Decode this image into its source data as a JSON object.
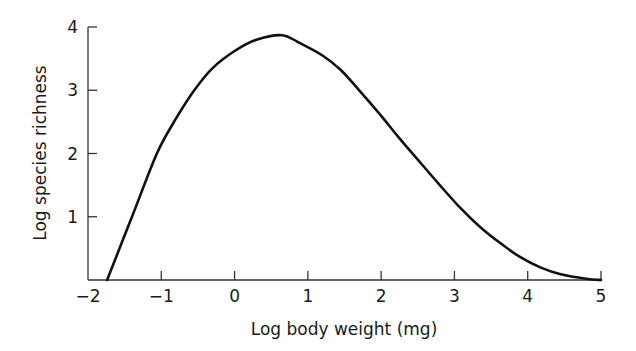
{
  "chart_data": {
    "type": "line",
    "title": "",
    "xlabel": "Log body weight (mg)",
    "ylabel": "Log species richness",
    "xlim": [
      -2,
      5
    ],
    "ylim": [
      0,
      4
    ],
    "x_ticks": [
      "−2",
      "−1",
      "0",
      "1",
      "2",
      "3",
      "4",
      "5"
    ],
    "y_ticks": [
      "1",
      "2",
      "3",
      "4"
    ],
    "grid": false,
    "legend": null,
    "series": [
      {
        "name": "species richness curve",
        "color": "#111111",
        "x": [
          -1.74,
          -1.4,
          -1.06,
          -0.8,
          -0.55,
          -0.3,
          0.0,
          0.3,
          0.65,
          0.9,
          1.2,
          1.45,
          1.7,
          1.99,
          2.25,
          2.54,
          2.8,
          3.08,
          3.35,
          3.63,
          3.9,
          4.17,
          4.45,
          4.8,
          5.0
        ],
        "values": [
          0.0,
          1.0,
          2.0,
          2.55,
          3.0,
          3.35,
          3.62,
          3.8,
          3.87,
          3.74,
          3.55,
          3.32,
          3.0,
          2.61,
          2.24,
          1.85,
          1.5,
          1.14,
          0.84,
          0.58,
          0.36,
          0.2,
          0.09,
          0.02,
          0.0
        ]
      }
    ]
  }
}
